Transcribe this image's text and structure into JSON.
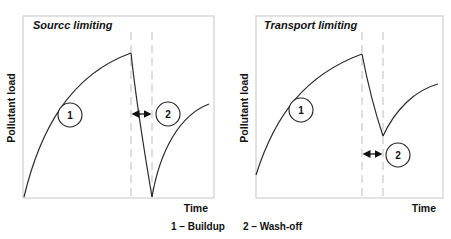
{
  "panels": [
    {
      "title": "Sourcc limiting",
      "ylabel": "Pollutant load",
      "xlabel": "Time",
      "markers": [
        "1",
        "2"
      ]
    },
    {
      "title": "Transport limiting",
      "ylabel": "Pollutant load",
      "xlabel": "Time",
      "markers": [
        "1",
        "2"
      ]
    }
  ],
  "legend": {
    "item1": "1 – Buildup",
    "item2": "2 – Wash-off"
  },
  "colors": {
    "curve": "#2a2a2a",
    "frame": "#cfcfcf",
    "dashed": "#bdbdbd"
  }
}
